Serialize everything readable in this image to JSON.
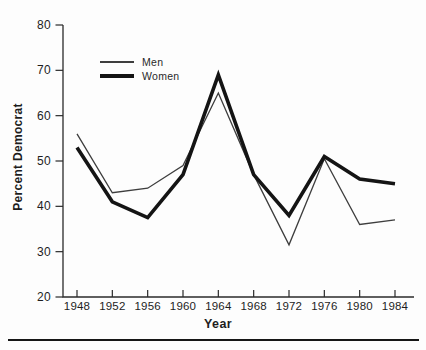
{
  "figure": {
    "background": "#fdfdfd",
    "axis_color": "#2b2b2b",
    "text_color": "#1d1d1d",
    "bottom_rule_color": "#161616"
  },
  "chart_data": {
    "type": "line",
    "title": "",
    "xlabel": "Year",
    "ylabel": "Percent Democrat",
    "x": [
      1948,
      1952,
      1956,
      1960,
      1964,
      1968,
      1972,
      1976,
      1980,
      1984
    ],
    "ylim": [
      20,
      80
    ],
    "yticks": [
      20,
      30,
      40,
      50,
      60,
      70,
      80
    ],
    "grid": false,
    "legend_position": "upper-left-inside",
    "series": [
      {
        "name": "Men",
        "line_style": "thin",
        "color": "#3e3e3e",
        "stroke_width": 1.3,
        "values": [
          56,
          43,
          44,
          49,
          65,
          47,
          31.5,
          50.5,
          36,
          37
        ]
      },
      {
        "name": "Women",
        "line_style": "thick",
        "color": "#141414",
        "stroke_width": 3.6,
        "values": [
          53,
          41,
          37.5,
          47,
          69,
          47,
          38,
          51,
          46,
          45
        ]
      }
    ]
  }
}
